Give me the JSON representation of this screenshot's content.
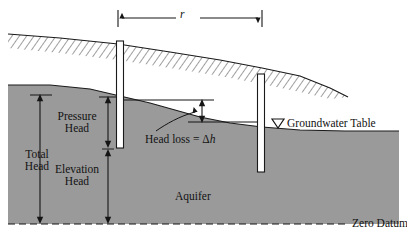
{
  "figure": {
    "type": "hydrogeology-cross-section-diagram",
    "title_visible": false,
    "background_color": "#ffffff",
    "line_color": "#151515",
    "aquifer_fill_color": "#9a9a9a",
    "well_fill_color": "#ffffff",
    "width_px": 407,
    "height_px": 242
  },
  "labels": {
    "radius": "r",
    "total_head": "Total\nHead",
    "total_head_line1": "Total",
    "total_head_line2": "Head",
    "pressure_head_line1": "Pressure",
    "pressure_head_line2": "Head",
    "elevation_head_line1": "Elevation",
    "elevation_head_line2": "Head",
    "head_loss": "Head loss = Δh",
    "head_loss_prefix": "Head loss = ",
    "head_loss_symbol_delta": "Δ",
    "head_loss_symbol_h": "h",
    "aquifer": "Aquifer",
    "groundwater_table": "Groundwater Table",
    "groundwater_table_symbol": "▽",
    "zero_datum": "Zero Datum"
  },
  "dimensions": {
    "r_span": {
      "label": "r",
      "x_start_px": 118,
      "x_end_px": 262,
      "y_px": 18,
      "description": "horizontal well-separation distance between the two observation wells"
    },
    "total_head": {
      "label": "Total Head",
      "x_px": 40,
      "y_top_px": 95,
      "y_bottom_px": 224,
      "description": "from water level in left well down to zero datum"
    },
    "pressure_head": {
      "label": "Pressure Head",
      "x_px": 108,
      "y_top_px": 97,
      "y_bottom_px": 148,
      "description": "from water level in left well down to well screen bottom"
    },
    "elevation_head": {
      "label": "Elevation Head",
      "x_px": 108,
      "y_top_px": 150,
      "y_bottom_px": 224,
      "description": "from left well bottom down to zero datum"
    },
    "head_loss": {
      "label": "Head loss = Δh",
      "x_px": 202,
      "y_top_px": 100,
      "y_bottom_px": 122,
      "description": "difference in water level between the two wells"
    }
  },
  "features": {
    "ground_surface": {
      "name": "ground-surface",
      "hatched": true,
      "hatch_side": "below",
      "description": "sloping hatched land surface from upper-left to lower-right"
    },
    "groundwater_table": {
      "name": "groundwater-table",
      "symbol": "▽",
      "description": "sloping phreatic surface, top of the shaded aquifer"
    },
    "aquifer": {
      "name": "aquifer",
      "fill": "#9a9a9a",
      "description": "shaded saturated zone below groundwater table"
    },
    "zero_datum": {
      "name": "zero-datum",
      "style": "dashed",
      "y_px": 224,
      "description": "horizontal dashed reference datum at the base of the figure"
    },
    "well_left": {
      "name": "observation-well-left",
      "x_px": 120,
      "y_top_px": 41,
      "y_bottom_px": 148
    },
    "well_right": {
      "name": "observation-well-right",
      "x_px": 261,
      "y_top_px": 74,
      "y_bottom_px": 172
    }
  }
}
